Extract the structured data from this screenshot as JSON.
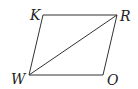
{
  "figure": {
    "type": "parallelogram",
    "name": "KROW",
    "stroke_color": "#333333",
    "vertices": [
      {
        "label": "K",
        "x": 43,
        "y": 15,
        "label_x": 30,
        "label_y": 20
      },
      {
        "label": "R",
        "x": 117,
        "y": 15,
        "label_x": 120,
        "label_y": 21
      },
      {
        "label": "O",
        "x": 103,
        "y": 75,
        "label_x": 107,
        "label_y": 85
      },
      {
        "label": "W",
        "x": 29,
        "y": 75,
        "label_x": 11,
        "label_y": 84
      }
    ],
    "diagonal": {
      "from": "W",
      "to": "R"
    }
  }
}
